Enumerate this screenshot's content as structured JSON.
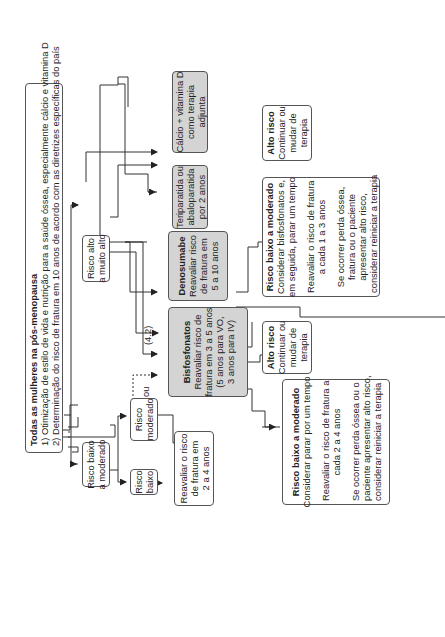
{
  "title": "Todas as mulheres na pós-menopausa",
  "intro": {
    "lines": [
      "1) Otimização de estilo de vida e nutrição para a saúde óssea, especialmente cálcio e vitamina D",
      "2) Determinação do risco de fratura em 10 anos de acordo com as diretrizes específicas do país"
    ]
  },
  "risk_levels": {
    "low_moderate": [
      "Risco baixo",
      "a moderado"
    ],
    "high_very_high": [
      "Risco alto",
      "a muito alto"
    ],
    "low": [
      "Risco",
      "baixo"
    ],
    "moderate": [
      "Risco",
      "moderado"
    ]
  },
  "reassess_low": [
    "Reavaliar o risco",
    "de fratura em",
    "2 a 4 anos"
  ],
  "or_label": "ou",
  "ref_label": "(4.2)",
  "therapies": {
    "bisphosphonates": {
      "title": "Bisfosfonatos",
      "lines": [
        "Reavaliar risco de",
        "fratura em 3 a 5 anos",
        "(5 anos para VO,",
        "3 anos para IV)"
      ]
    },
    "denosumab": {
      "title": "Denosumabe",
      "lines": [
        "Reavaliar risco",
        "de fratura em",
        "5 a 10 anos"
      ]
    },
    "teriparatide": {
      "lines": [
        "Teriparatida ou",
        "abaloparatida",
        "por 2 anos"
      ]
    },
    "calcium": {
      "lines": [
        "Cálcio + vitamina D",
        "como terapia",
        "adjunta"
      ]
    }
  },
  "outcomes": {
    "bis_low": {
      "title": "Risco baixo a moderado",
      "lines": [
        "Considerar parar por um tempo"
      ],
      "reassess": [
        "Reavaliar o risco de fratura a",
        "cada 2 a 4 anos"
      ],
      "note": [
        "Se ocorrer perda óssea ou o",
        "paciente apresentar alto risco,",
        "considerar reiniciar a terapia"
      ]
    },
    "bis_high": {
      "title": "Alto risco",
      "lines": [
        "Continuar ou",
        "mudar de",
        "terapia"
      ]
    },
    "den_low": {
      "title": "Risco baixo a moderado",
      "lines": [
        "Considerar bisfosfonatos e,",
        "em seguida, parar um tempo"
      ],
      "reassess": [
        "Reavaliar o risco de fratura",
        "a cada 1 a 3 anos"
      ],
      "note": [
        "Se ocorrer perda óssea,",
        "fratura ou o paciente",
        "apresentar alto risco,",
        "considerar reiniciar a terapia"
      ]
    },
    "den_high": {
      "title": "Alto risco",
      "lines": [
        "Continuar ou",
        "mudar de",
        "terapia"
      ]
    }
  },
  "colors": {
    "line": "#333333",
    "box_border": "#555555",
    "therapy_fill": "#d4d4d4",
    "background": "#ffffff"
  }
}
